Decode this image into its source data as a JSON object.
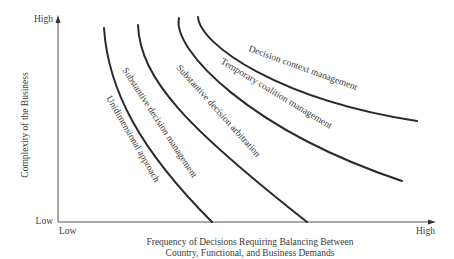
{
  "diagram": {
    "y_axis": {
      "title": "Complexity of the Business",
      "high_label": "High",
      "low_label": "Low"
    },
    "x_axis": {
      "title_line1": "Frequency of Decisions Requiring Balancing Between",
      "title_line2": "Country, Functional, and Business Demands",
      "low_label": "Low",
      "high_label": "High"
    },
    "curves": [
      {
        "label": "Unidimensional approach"
      },
      {
        "label": "Substantive decision management"
      },
      {
        "label": "Substantive decision arbitration"
      },
      {
        "label": "Temporary coalition management"
      },
      {
        "label": "Decision context management"
      }
    ],
    "colors": {
      "line": "#2a2a2a",
      "text": "#3a3a3a",
      "background": "#ffffff"
    }
  }
}
